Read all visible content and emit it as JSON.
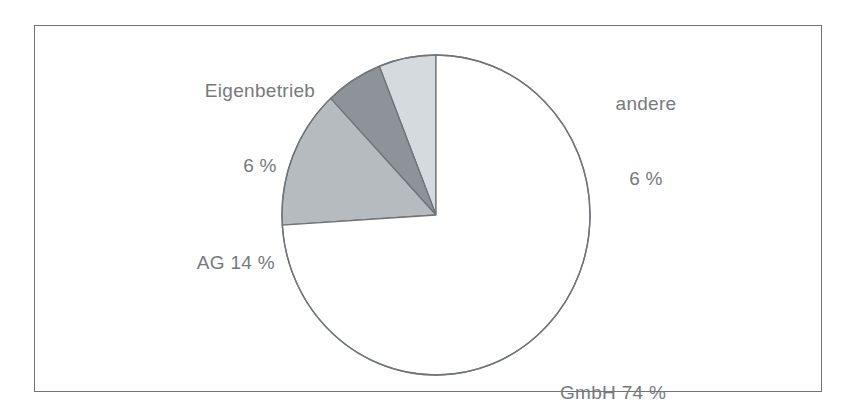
{
  "figure": {
    "name": "pie-chart-rechtsform",
    "background_color": "#ffffff",
    "frame_color": "#6f7479",
    "label_color": "#77797c"
  },
  "labels": {
    "eigenbetrieb_name": "Eigenbetrieb",
    "eigenbetrieb_value": "6 %",
    "andere_name": "andere",
    "andere_value": "6 %",
    "ag_combined": "AG 14 %",
    "gmbh_combined": "GmbH 74 %"
  },
  "chart_data": {
    "type": "pie",
    "title": "",
    "subtitle": "",
    "xlabel": "",
    "ylabel": "",
    "legend_position": "none",
    "grid": false,
    "start_angle_deg": 90,
    "direction": "counterclockwise",
    "value_unit": "percent",
    "categories": [
      "andere",
      "Eigenbetrieb",
      "AG",
      "GmbH"
    ],
    "values": [
      6,
      6,
      14,
      74
    ],
    "colors": [
      "#d5dade",
      "#8e939a",
      "#b6bbc0",
      "#ffffff"
    ],
    "slice_outline_color": "#6f7479",
    "labels": [
      "andere 6 %",
      "Eigenbetrieb 6 %",
      "AG 14 %",
      "GmbH 74 %"
    ],
    "slices": [
      {
        "name": "andere",
        "value": 6,
        "display_value": "6 %",
        "color": "#d5dade",
        "label_text": "andere",
        "label_position": "outside-top-right"
      },
      {
        "name": "Eigenbetrieb",
        "value": 6,
        "display_value": "6 %",
        "color": "#8e939a",
        "label_text": "Eigenbetrieb",
        "label_position": "outside-top-left"
      },
      {
        "name": "AG",
        "value": 14,
        "display_value": "14 %",
        "color": "#b6bbc0",
        "label_text": "AG",
        "label_position": "outside-left"
      },
      {
        "name": "GmbH",
        "value": 74,
        "display_value": "74 %",
        "color": "#ffffff",
        "label_text": "GmbH",
        "label_position": "outside-bottom-right"
      }
    ]
  }
}
